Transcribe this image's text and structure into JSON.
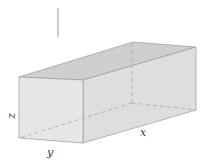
{
  "diagram": {
    "type": "rectangular-box",
    "labels": {
      "x": "x",
      "y": "y",
      "z": "z"
    },
    "colors": {
      "front_face": "#e6e6e6",
      "top_face": "#cfcfcf",
      "side_face": "#dedede",
      "edge": "#9a9a9a",
      "hidden_edge": "#a8a8a8",
      "stick": "#999999"
    }
  }
}
